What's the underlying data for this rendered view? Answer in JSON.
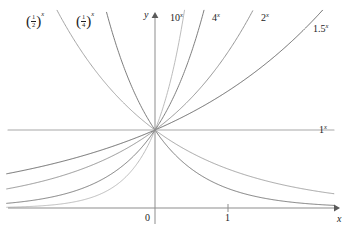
{
  "figure": {
    "title": "",
    "background_color": "#ffffff"
  },
  "axes": {
    "x_axis_label": "x",
    "y_axis_label": "y",
    "origin_label": "0",
    "x_tick_labels": [
      "1"
    ],
    "x_tick_values": [
      1
    ]
  },
  "labels": {
    "half_base": "1",
    "half_den": "2",
    "quarter_base": "1",
    "quarter_den": "4",
    "exp_x": "x",
    "ten": "10",
    "four": "4",
    "two": "2",
    "one_point_five": "1.5",
    "one": "1"
  },
  "chart_data": {
    "type": "line",
    "title": "",
    "xlabel": "x",
    "ylabel": "y",
    "xlim": [
      -2.12,
      2.55
    ],
    "ylim": [
      -0.05,
      2.5
    ],
    "grid": false,
    "legend": "inline-curve-labels",
    "note": "Family of exponential functions y = a^x, all passing through the point (0, 1).",
    "series": [
      {
        "name": "(1/2)^x",
        "base": 0.5,
        "label": "(1/2)^x",
        "color": "#9a9a9a",
        "label_position": {
          "x": 30,
          "y": 18
        },
        "x": [
          -2.12,
          -1.8,
          -1.5,
          -1.2,
          -0.9,
          -0.6,
          -0.3,
          0,
          0.3,
          0.6,
          0.9,
          1.2,
          1.5,
          1.8,
          2.1,
          2.4,
          2.55
        ],
        "y": [
          4.35,
          3.48,
          2.83,
          2.3,
          1.87,
          1.52,
          1.23,
          1.0,
          0.81,
          0.66,
          0.54,
          0.44,
          0.35,
          0.29,
          0.23,
          0.19,
          0.17
        ]
      },
      {
        "name": "(1/4)^x",
        "base": 0.25,
        "label": "(1/4)^x",
        "color": "#6e6e6e",
        "label_position": {
          "x": 80,
          "y": 18
        },
        "x": [
          -2.12,
          -1.8,
          -1.5,
          -1.2,
          -0.9,
          -0.6,
          -0.3,
          0,
          0.3,
          0.6,
          0.9,
          1.2,
          1.5,
          1.8,
          2.1,
          2.4,
          2.55
        ],
        "y": [
          18.9,
          12.1,
          8.0,
          5.28,
          3.48,
          2.3,
          1.52,
          1.0,
          0.66,
          0.44,
          0.29,
          0.19,
          0.125,
          0.082,
          0.054,
          0.036,
          0.029
        ]
      },
      {
        "name": "10^x",
        "base": 10,
        "label": "10^x",
        "color": "#b4b4b4",
        "label_position": {
          "x": 172,
          "y": 15
        },
        "x": [
          -2.12,
          -1.8,
          -1.5,
          -1.2,
          -0.9,
          -0.6,
          -0.3,
          0,
          0.3,
          0.6,
          0.9,
          1.2,
          1.5
        ],
        "y": [
          0.0076,
          0.0158,
          0.0316,
          0.063,
          0.126,
          0.251,
          0.501,
          1.0,
          2.0,
          3.98,
          7.94,
          15.8,
          31.6
        ]
      },
      {
        "name": "4^x",
        "base": 4,
        "label": "4^x",
        "color": "#707070",
        "label_position": {
          "x": 214,
          "y": 15
        },
        "x": [
          -2.12,
          -1.8,
          -1.5,
          -1.2,
          -0.9,
          -0.6,
          -0.3,
          0,
          0.3,
          0.6,
          0.9,
          1.2,
          1.5,
          1.8
        ],
        "y": [
          0.053,
          0.082,
          0.125,
          0.19,
          0.29,
          0.44,
          0.66,
          1.0,
          1.52,
          2.3,
          3.48,
          5.28,
          8.0,
          12.1
        ]
      },
      {
        "name": "2^x",
        "base": 2,
        "label": "2^x",
        "color": "#8a8a8a",
        "label_position": {
          "x": 263,
          "y": 15
        },
        "x": [
          -2.12,
          -1.8,
          -1.5,
          -1.2,
          -0.9,
          -0.6,
          -0.3,
          0,
          0.3,
          0.6,
          0.9,
          1.2,
          1.5,
          1.8,
          2.1,
          2.4
        ],
        "y": [
          0.23,
          0.29,
          0.35,
          0.44,
          0.54,
          0.66,
          0.81,
          1.0,
          1.23,
          1.52,
          1.87,
          2.3,
          2.83,
          3.48,
          4.29,
          5.28
        ]
      },
      {
        "name": "1.5^x",
        "base": 1.5,
        "label": "1.5^x",
        "color": "#5c5c5c",
        "label_position": {
          "x": 315,
          "y": 26
        },
        "x": [
          -2.12,
          -1.8,
          -1.5,
          -1.2,
          -0.9,
          -0.6,
          -0.3,
          0,
          0.3,
          0.6,
          0.9,
          1.2,
          1.5,
          1.8,
          2.1,
          2.4,
          2.55
        ],
        "y": [
          0.43,
          0.49,
          0.54,
          0.61,
          0.68,
          0.77,
          0.88,
          1.0,
          1.13,
          1.28,
          1.45,
          1.64,
          1.84,
          2.08,
          2.35,
          2.66,
          2.83
        ]
      },
      {
        "name": "1^x",
        "base": 1,
        "label": "1^x",
        "color": "#a8a8a8",
        "label_position": {
          "x": 320,
          "y": 125
        },
        "x": [
          -2.12,
          2.55
        ],
        "y": [
          1.0,
          1.0
        ]
      }
    ]
  }
}
